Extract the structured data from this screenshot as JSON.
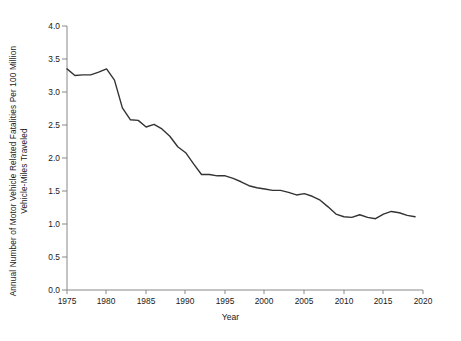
{
  "chart_data": {
    "type": "line",
    "title": "",
    "xlabel": "Year",
    "ylabel": "Annual Number of Motor Vehicle Related Fatalities Per 100 Million Vehicle-Miles Traveled",
    "ylabel_line1": "Annual Number of Motor Vehicle Related Fatalities Per 100 Million",
    "ylabel_line2": "Vehicle-Miles Traveled",
    "xlim": [
      1975,
      2020
    ],
    "ylim": [
      0.0,
      4.0
    ],
    "xticks": [
      1975,
      1980,
      1985,
      1990,
      1995,
      2000,
      2005,
      2010,
      2015,
      2020
    ],
    "xtick_labels": [
      "1975",
      "1980",
      "1985",
      "1990",
      "1995",
      "2000",
      "2005",
      "2010",
      "2015",
      "2020"
    ],
    "yticks": [
      0.0,
      0.5,
      1.0,
      1.5,
      2.0,
      2.5,
      3.0,
      3.5,
      4.0
    ],
    "ytick_labels": [
      "0.0",
      "0.5",
      "1.0",
      "1.5",
      "2.0",
      "2.5",
      "3.0",
      "3.5",
      "4.0"
    ],
    "grid": false,
    "legend": false,
    "legend_position": "none",
    "line_color": "#333333",
    "line_width": 1.4,
    "x": [
      1975,
      1976,
      1977,
      1978,
      1979,
      1980,
      1981,
      1982,
      1983,
      1984,
      1985,
      1986,
      1987,
      1988,
      1989,
      1990,
      1991,
      1992,
      1993,
      1994,
      1995,
      1996,
      1997,
      1998,
      1999,
      2000,
      2001,
      2002,
      2003,
      2004,
      2005,
      2006,
      2007,
      2008,
      2009,
      2010,
      2011,
      2012,
      2013,
      2014,
      2015,
      2016,
      2017,
      2018,
      2019
    ],
    "values": [
      3.35,
      3.25,
      3.26,
      3.26,
      3.3,
      3.35,
      3.18,
      2.76,
      2.58,
      2.57,
      2.47,
      2.51,
      2.44,
      2.33,
      2.17,
      2.08,
      1.91,
      1.75,
      1.75,
      1.73,
      1.73,
      1.69,
      1.64,
      1.58,
      1.55,
      1.53,
      1.51,
      1.51,
      1.48,
      1.44,
      1.46,
      1.42,
      1.36,
      1.26,
      1.15,
      1.11,
      1.1,
      1.14,
      1.1,
      1.08,
      1.15,
      1.19,
      1.17,
      1.13,
      1.11
    ],
    "series": [
      {
        "name": "Fatality rate per 100 million VMT",
        "values": [
          3.35,
          3.25,
          3.26,
          3.26,
          3.3,
          3.35,
          3.18,
          2.76,
          2.58,
          2.57,
          2.47,
          2.51,
          2.44,
          2.33,
          2.17,
          2.08,
          1.91,
          1.75,
          1.75,
          1.73,
          1.73,
          1.69,
          1.64,
          1.58,
          1.55,
          1.53,
          1.51,
          1.51,
          1.48,
          1.44,
          1.46,
          1.42,
          1.36,
          1.26,
          1.15,
          1.11,
          1.1,
          1.14,
          1.1,
          1.08,
          1.15,
          1.19,
          1.17,
          1.13,
          1.11
        ]
      }
    ]
  }
}
